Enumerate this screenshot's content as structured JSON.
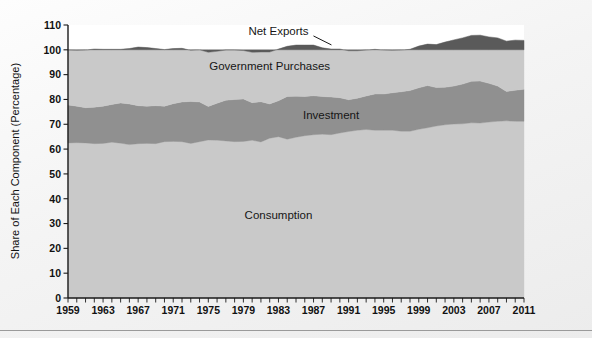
{
  "chart_data": {
    "type": "area",
    "subtype": "stacked-area-100-percent",
    "title": "",
    "xlabel": "",
    "ylabel": "Share of Each Component (Percentage)",
    "xlim": [
      1959,
      2011
    ],
    "ylim": [
      0,
      110
    ],
    "ytick_step": 10,
    "xtick_step": 4,
    "xtick_minor_step": 1,
    "grid": false,
    "legend_position": "inline-annotations",
    "ytick_labels": [
      "0",
      "10",
      "20",
      "30",
      "40",
      "50",
      "60",
      "70",
      "80",
      "90",
      "100",
      "110"
    ],
    "xtick_labels": [
      "1959",
      "1963",
      "1967",
      "1971",
      "1975",
      "1979",
      "1983",
      "1987",
      "1991",
      "1995",
      "1999",
      "2003",
      "2007",
      "2011"
    ],
    "annotations": [
      {
        "text": "Net Exports",
        "x": 1983,
        "y": 106,
        "color": "#161616",
        "leader": true
      },
      {
        "text": "Government Purchases",
        "x": 1982,
        "y": 92,
        "color": "#161616",
        "leader": false
      },
      {
        "text": "Investment",
        "x": 1989,
        "y": 72,
        "color": "#e9e9e9",
        "leader": false
      },
      {
        "text": "Consumption",
        "x": 1983,
        "y": 32,
        "color": "#161616",
        "leader": false
      }
    ],
    "x": [
      1959,
      1960,
      1961,
      1962,
      1963,
      1964,
      1965,
      1966,
      1967,
      1968,
      1969,
      1970,
      1971,
      1972,
      1973,
      1974,
      1975,
      1976,
      1977,
      1978,
      1979,
      1980,
      1981,
      1982,
      1983,
      1984,
      1985,
      1986,
      1987,
      1988,
      1989,
      1990,
      1991,
      1992,
      1993,
      1994,
      1995,
      1996,
      1997,
      1998,
      1999,
      2000,
      2001,
      2002,
      2003,
      2004,
      2005,
      2006,
      2007,
      2008,
      2009,
      2010,
      2011
    ],
    "series": [
      {
        "name": "Consumption",
        "color": "#c9c9c9",
        "values": [
          62.5,
          62.6,
          62.5,
          62.2,
          62.3,
          62.8,
          62.4,
          61.8,
          62.2,
          62.3,
          62.2,
          63.0,
          63.1,
          63.0,
          62.3,
          63.0,
          63.7,
          63.6,
          63.3,
          63.0,
          63.1,
          63.6,
          62.9,
          64.4,
          65.0,
          64.0,
          64.8,
          65.4,
          65.8,
          66.0,
          65.8,
          66.5,
          67.1,
          67.6,
          67.9,
          67.6,
          67.6,
          67.6,
          67.2,
          67.2,
          68.0,
          68.6,
          69.3,
          69.8,
          70.1,
          70.2,
          70.6,
          70.5,
          70.9,
          71.2,
          71.4,
          71.2,
          71.2
        ]
      },
      {
        "name": "Investment",
        "color": "#909090",
        "values": [
          15.3,
          14.7,
          14.2,
          14.7,
          15.0,
          15.2,
          16.2,
          16.4,
          15.3,
          15.0,
          15.3,
          14.3,
          15.2,
          16.0,
          16.9,
          16.0,
          13.5,
          14.9,
          16.4,
          17.0,
          17.1,
          15.1,
          16.2,
          13.8,
          14.5,
          17.2,
          16.5,
          15.8,
          15.7,
          15.2,
          15.2,
          14.2,
          12.8,
          12.9,
          13.5,
          14.6,
          14.6,
          15.1,
          15.9,
          16.4,
          16.7,
          17.0,
          15.5,
          15.1,
          15.3,
          16.0,
          16.7,
          16.9,
          15.6,
          14.2,
          11.8,
          12.5,
          12.9
        ]
      },
      {
        "name": "Government Purchases",
        "color": "#c9c9c9",
        "values": [
          22.1,
          22.5,
          23.2,
          23.4,
          22.9,
          22.2,
          21.6,
          22.3,
          23.6,
          23.6,
          23.0,
          22.8,
          22.2,
          21.6,
          20.6,
          21.0,
          21.8,
          20.9,
          20.2,
          19.9,
          19.5,
          20.3,
          20.0,
          20.9,
          20.8,
          20.2,
          20.6,
          20.7,
          20.4,
          19.6,
          19.3,
          19.6,
          19.7,
          19.1,
          18.5,
          18.0,
          17.7,
          17.1,
          16.8,
          16.6,
          16.8,
          16.7,
          17.3,
          18.2,
          18.6,
          18.6,
          18.5,
          18.5,
          18.7,
          19.4,
          20.3,
          20.2,
          19.7
        ]
      },
      {
        "name": "Net Exports",
        "color": "#5a5a5a",
        "values": [
          0.1,
          0.2,
          0.1,
          -0.3,
          -0.2,
          -0.2,
          -0.2,
          -0.5,
          -1.1,
          -0.9,
          -0.5,
          -0.1,
          -0.5,
          -0.6,
          0.2,
          0.0,
          1.0,
          0.6,
          0.1,
          0.1,
          0.3,
          1.0,
          0.9,
          0.9,
          -0.3,
          -1.4,
          -1.9,
          -1.9,
          -1.9,
          -0.8,
          -0.3,
          -0.3,
          0.4,
          0.4,
          0.1,
          -0.2,
          0.1,
          0.2,
          0.1,
          -0.2,
          -1.5,
          -2.3,
          -2.1,
          -3.1,
          -4.0,
          -4.8,
          -5.8,
          -5.9,
          -5.2,
          -4.8,
          -3.5,
          -3.9,
          -3.8
        ]
      }
    ]
  },
  "axis": {
    "y_title": "Share of Each Component (Percentage)"
  }
}
